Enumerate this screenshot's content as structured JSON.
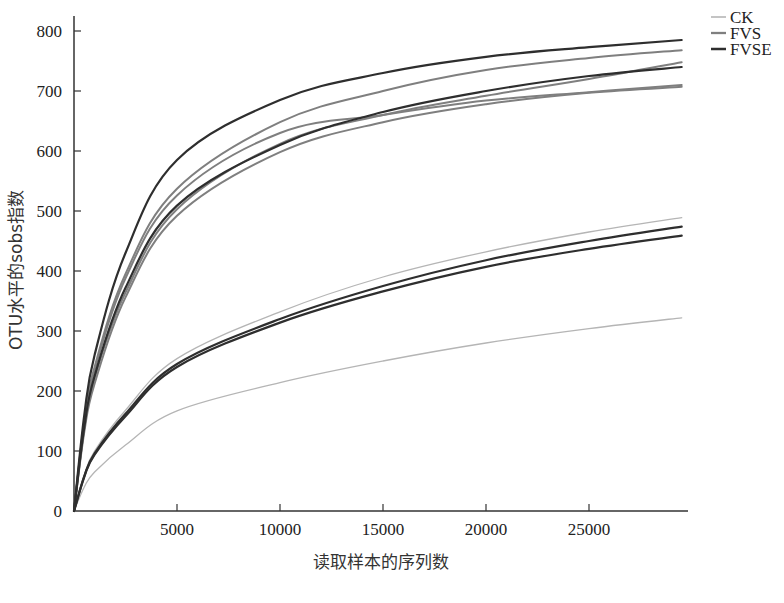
{
  "chart_data": {
    "type": "line",
    "title": "",
    "xlabel": "读取样本的序列数",
    "ylabel": "OTU水平的sobs指数",
    "xlim": [
      0,
      29800
    ],
    "ylim": [
      0,
      820
    ],
    "xticks": [
      5000,
      10000,
      15000,
      20000,
      25000
    ],
    "xtick_labels": [
      "5000",
      "10000",
      "15000",
      "20000",
      "25000"
    ],
    "yticks": [
      0,
      100,
      200,
      300,
      400,
      500,
      600,
      700,
      800
    ],
    "ytick_labels": [
      "0",
      "100",
      "200",
      "300",
      "400",
      "500",
      "600",
      "700",
      "800"
    ],
    "grid": false,
    "legend_position": "top-right-outside",
    "legend": [
      {
        "name": "CK",
        "color": "#b5b5b5",
        "width": 1.3
      },
      {
        "name": "FVS",
        "color": "#7f7f7f",
        "width": 2.0
      },
      {
        "name": "FVSE",
        "color": "#2e2e2e",
        "width": 2.2
      }
    ],
    "x": [
      0,
      500,
      1000,
      2500,
      5000,
      10000,
      15000,
      20000,
      25000,
      29500
    ],
    "series": [
      {
        "name": "FVSE",
        "group": "FVSE",
        "values": [
          0,
          160,
          260,
          430,
          585,
          685,
          730,
          757,
          773,
          785
        ]
      },
      {
        "name": "FVS",
        "group": "FVS",
        "values": [
          0,
          150,
          240,
          395,
          537,
          648,
          700,
          735,
          755,
          768
        ]
      },
      {
        "name": "FVS",
        "group": "FVS",
        "values": [
          0,
          148,
          235,
          388,
          526,
          630,
          660,
          684,
          698,
          710
        ]
      },
      {
        "name": "FVSE",
        "group": "FVSE",
        "values": [
          0,
          140,
          225,
          372,
          509,
          610,
          665,
          700,
          725,
          740
        ]
      },
      {
        "name": "FVS",
        "group": "FVS",
        "values": [
          0,
          138,
          222,
          364,
          503,
          612,
          660,
          692,
          720,
          748
        ]
      },
      {
        "name": "FVS",
        "group": "FVS",
        "values": [
          0,
          132,
          212,
          356,
          492,
          598,
          648,
          678,
          697,
          707
        ]
      },
      {
        "name": "CK",
        "group": "CK",
        "values": [
          0,
          60,
          100,
          168,
          254,
          332,
          390,
          432,
          465,
          489
        ]
      },
      {
        "name": "FVSE",
        "group": "FVSE",
        "values": [
          0,
          58,
          96,
          162,
          245,
          320,
          375,
          418,
          450,
          474
        ]
      },
      {
        "name": "FVSE",
        "group": "FVSE",
        "values": [
          0,
          57,
          94,
          158,
          240,
          314,
          366,
          407,
          437,
          459
        ]
      },
      {
        "name": "CK",
        "group": "CK",
        "values": [
          0,
          40,
          65,
          110,
          167,
          214,
          250,
          280,
          304,
          322
        ]
      }
    ]
  }
}
